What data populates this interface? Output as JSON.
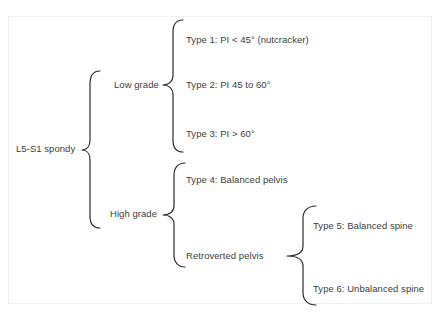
{
  "diagram": {
    "root": {
      "label": "L5-S1 spondy"
    },
    "branches": [
      {
        "label": "Low grade",
        "children": [
          {
            "label": "Type 1: PI < 45° (nutcracker)"
          },
          {
            "label": "Type 2: PI 45 to 60°"
          },
          {
            "label": "Type 3: PI > 60°"
          }
        ]
      },
      {
        "label": "High grade",
        "children": [
          {
            "label": "Type 4: Balanced pelvis"
          },
          {
            "label": "Retroverted pelvis",
            "children": [
              {
                "label": "Type 5: Balanced spine"
              },
              {
                "label": "Type 6: Unbalanced spine"
              }
            ]
          }
        ]
      }
    ],
    "colors": {
      "text": "#3d3d3d",
      "brace": "#2b2b2b",
      "background": "#ffffff",
      "frame": "#f0f0f0"
    }
  }
}
